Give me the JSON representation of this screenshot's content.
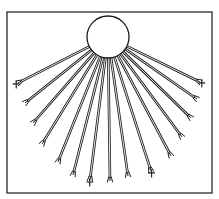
{
  "figure": {
    "colors": {
      "line": "#1a1a1a",
      "background": "#ffffff",
      "frame": "#2a2a2a"
    },
    "frame": {
      "x": 7,
      "y": 12,
      "width": 205,
      "height": 181
    },
    "hub": {
      "cx": 108,
      "cy": 37,
      "r": 21
    },
    "tubes": [
      {
        "x2": 18,
        "y2": 83,
        "marked": true
      },
      {
        "x2": 25,
        "y2": 103,
        "marked": false
      },
      {
        "x2": 33,
        "y2": 123,
        "marked": false
      },
      {
        "x2": 42,
        "y2": 144,
        "marked": false
      },
      {
        "x2": 58,
        "y2": 162,
        "marked": false
      },
      {
        "x2": 73,
        "y2": 175,
        "marked": false
      },
      {
        "x2": 90,
        "y2": 180,
        "marked": true
      },
      {
        "x2": 110,
        "y2": 181,
        "marked": false
      },
      {
        "x2": 128,
        "y2": 176,
        "marked": false
      },
      {
        "x2": 151,
        "y2": 171,
        "marked": true
      },
      {
        "x2": 171,
        "y2": 156,
        "marked": false
      },
      {
        "x2": 182,
        "y2": 137,
        "marked": false
      },
      {
        "x2": 191,
        "y2": 118,
        "marked": false
      },
      {
        "x2": 197,
        "y2": 99,
        "marked": false
      },
      {
        "x2": 200,
        "y2": 82,
        "marked": true
      }
    ]
  }
}
